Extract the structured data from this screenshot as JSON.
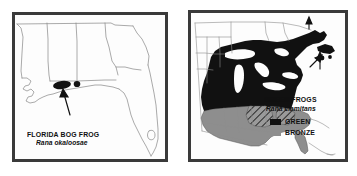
{
  "figure": {
    "type": "two-panel-range-map",
    "background": "#ffffff",
    "frame_color": "#3a3a3a",
    "panels": 2
  },
  "left_panel": {
    "name": "florida-bog-frog-range-map",
    "region": "Gulf Coast — Louisiana, Mississippi, Alabama, Georgia, Florida",
    "caption_common": "FLORIDA BOG FROG",
    "caption_latin": "Rana okaloosae",
    "range_fill": "#111111",
    "outline_color": "#8a8a8a",
    "annotations": [
      {
        "kind": "arrow",
        "points_to": "range-patch-florida-panhandle"
      }
    ],
    "range_patches": 2
  },
  "right_panel": {
    "name": "green-frog-range-map",
    "region": "Eastern United States and southeastern Canada",
    "caption_common": "GREEN FROGS",
    "caption_latin": "Rana clamitans",
    "outline_color": "#8a8a8a",
    "legend": {
      "name": "subspecies-legend",
      "items": [
        {
          "label": "GREEN",
          "color": "#111111",
          "swatch": "swatch-green"
        },
        {
          "label": "BRONZE",
          "color": "#8e8e8e",
          "swatch": "swatch-bronze"
        }
      ]
    },
    "annotations": [
      {
        "kind": "arrow",
        "points_to": "northeast-island-populations-1"
      },
      {
        "kind": "arrow",
        "points_to": "northeast-island-populations-2"
      },
      {
        "kind": "arrow",
        "points_to": "northeast-island-populations-3"
      }
    ]
  },
  "colors": {
    "green_range": "#111111",
    "bronze_range": "#8e8e8e",
    "overlap_hatch": "#6d6d6d",
    "frame": "#3a3a3a",
    "coastline": "#8a8a8a",
    "paper": "#fdfdfd"
  }
}
